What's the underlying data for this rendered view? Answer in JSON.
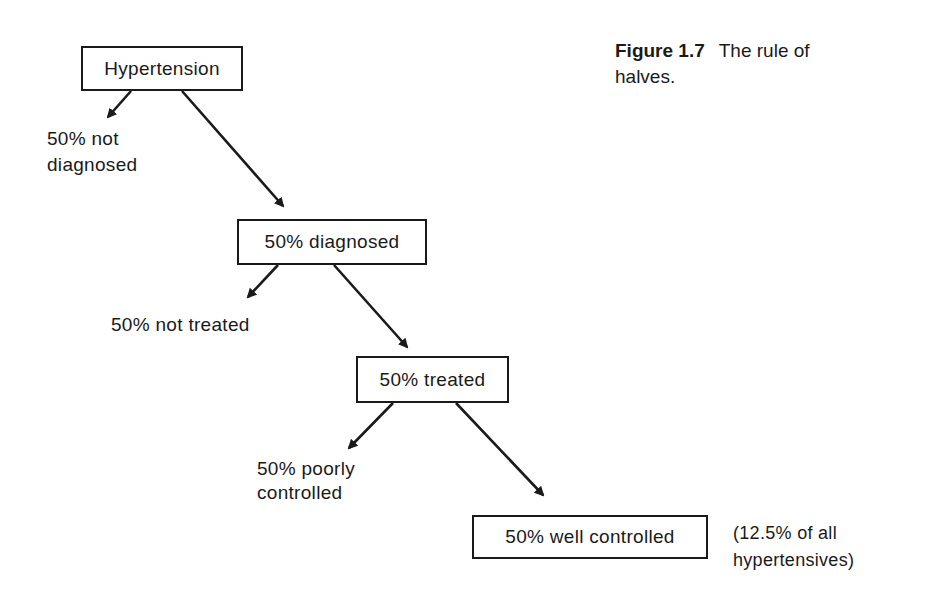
{
  "caption": {
    "figure_label": "Figure 1.7",
    "title_line1": "The rule of",
    "title_line2": "halves."
  },
  "nodes": {
    "hypertension": {
      "label": "Hypertension"
    },
    "diagnosed": {
      "label": "50% diagnosed"
    },
    "treated": {
      "label": "50% treated"
    },
    "well_controlled": {
      "label": "50% well controlled"
    }
  },
  "branches": {
    "not_diagnosed": {
      "line1": "50% not",
      "line2": "diagnosed"
    },
    "not_treated": {
      "line1": "50% not treated"
    },
    "poorly_controlled": {
      "line1": "50% poorly",
      "line2": "controlled"
    }
  },
  "note": {
    "line1": "(12.5% of all",
    "line2": "hypertensives)"
  },
  "edges": [
    {
      "from": "Hypertension",
      "to": "50% not diagnosed"
    },
    {
      "from": "Hypertension",
      "to": "50% diagnosed"
    },
    {
      "from": "50% diagnosed",
      "to": "50% not treated"
    },
    {
      "from": "50% diagnosed",
      "to": "50% treated"
    },
    {
      "from": "50% treated",
      "to": "50% poorly controlled"
    },
    {
      "from": "50% treated",
      "to": "50% well controlled"
    }
  ],
  "colors": {
    "ink": "#1a1a1a",
    "background": "#ffffff"
  }
}
